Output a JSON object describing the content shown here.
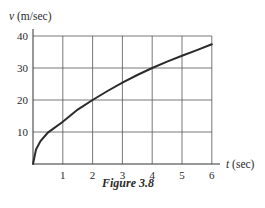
{
  "chart_data": {
    "type": "line",
    "title": "",
    "caption": "Figure 3.8",
    "xlabel": "t (sec)",
    "xlabel_var": "t",
    "xlabel_unit": "(sec)",
    "ylabel": "v (m/sec)",
    "ylabel_var": "v",
    "ylabel_unit": "(m/sec)",
    "xlim": [
      0,
      6
    ],
    "ylim": [
      0,
      40
    ],
    "xticks": [
      1,
      2,
      3,
      4,
      5,
      6
    ],
    "yticks": [
      10,
      20,
      30,
      40
    ],
    "xtick_labels": [
      "1",
      "2",
      "3",
      "4",
      "5",
      "6"
    ],
    "ytick_labels": [
      "10",
      "20",
      "30",
      "40"
    ],
    "grid": true,
    "legend": null,
    "series": [
      {
        "name": "v(t)",
        "x": [
          0,
          0.1,
          0.25,
          0.5,
          1,
          1.5,
          2,
          2.5,
          3,
          3.5,
          4,
          4.5,
          5,
          5.5,
          6
        ],
        "y": [
          0,
          4.5,
          7.2,
          9.8,
          13.2,
          17.0,
          20.0,
          22.8,
          25.4,
          27.8,
          30.0,
          32.0,
          33.8,
          35.6,
          37.4
        ]
      }
    ],
    "colors": {
      "line": "#2b2b2b",
      "grid": "#555555",
      "background": "#ffffff"
    }
  }
}
